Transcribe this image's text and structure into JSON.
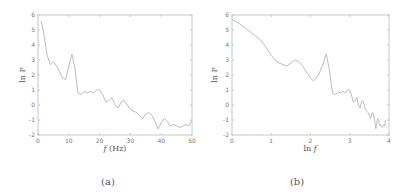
{
  "chart_data": [
    {
      "type": "line",
      "panel_caption": "(a)",
      "title": "",
      "xlabel": "f (Hz)",
      "ylabel": "ln P",
      "xlim": [
        0,
        50
      ],
      "ylim": [
        -2,
        6
      ],
      "xticks": [
        0,
        10,
        20,
        30,
        40,
        50
      ],
      "yticks": [
        -2,
        -1,
        0,
        1,
        2,
        3,
        4,
        5,
        6
      ],
      "grid": false,
      "legend": null,
      "x": [
        1,
        2,
        3,
        4,
        5,
        6,
        7,
        8,
        9,
        10,
        11,
        12,
        13,
        14,
        15,
        16,
        17,
        18,
        19,
        20,
        21,
        22,
        23,
        24,
        25,
        26,
        27,
        28,
        29,
        30,
        31,
        32,
        33,
        34,
        35,
        36,
        37,
        38,
        39,
        40,
        41,
        42,
        43,
        44,
        45,
        46,
        47,
        48,
        49,
        50
      ],
      "y": [
        5.6,
        4.6,
        3.3,
        2.7,
        2.9,
        2.6,
        2.2,
        1.8,
        1.7,
        2.6,
        3.4,
        2.4,
        0.8,
        0.7,
        0.9,
        0.8,
        0.9,
        0.8,
        1.0,
        1.0,
        0.7,
        0.2,
        0.3,
        0.5,
        0.0,
        -0.2,
        0.2,
        0.3,
        0.0,
        -0.3,
        -0.4,
        -0.5,
        -0.7,
        -0.9,
        -0.6,
        -0.5,
        -0.7,
        -1.1,
        -1.6,
        -1.2,
        -0.9,
        -1.1,
        -1.4,
        -1.3,
        -1.4,
        -1.5,
        -1.4,
        -1.3,
        -1.4,
        -1.0
      ]
    },
    {
      "type": "line",
      "panel_caption": "(b)",
      "title": "",
      "xlabel": "ln f",
      "ylabel": "ln P",
      "xlim": [
        0,
        4
      ],
      "ylim": [
        -2,
        6
      ],
      "xticks": [
        0,
        1,
        2,
        3,
        4
      ],
      "yticks": [
        -2,
        -1,
        0,
        1,
        2,
        3,
        4,
        5,
        6
      ],
      "grid": false,
      "legend": null,
      "x": [
        0.0,
        0.2,
        0.4,
        0.6,
        0.7,
        0.8,
        0.9,
        1.0,
        1.1,
        1.2,
        1.3,
        1.4,
        1.5,
        1.6,
        1.7,
        1.8,
        1.9,
        2.0,
        2.08,
        2.2,
        2.3,
        2.4,
        2.48,
        2.56,
        2.64,
        2.71,
        2.77,
        2.83,
        2.89,
        2.94,
        3.0,
        3.04,
        3.09,
        3.14,
        3.18,
        3.22,
        3.26,
        3.3,
        3.33,
        3.37,
        3.4,
        3.43,
        3.47,
        3.5,
        3.53,
        3.56,
        3.58,
        3.61,
        3.64,
        3.66,
        3.69,
        3.71,
        3.74,
        3.76,
        3.78,
        3.81,
        3.83,
        3.85,
        3.87,
        3.89,
        3.91
      ],
      "y": [
        5.7,
        5.4,
        5.0,
        4.6,
        4.4,
        4.1,
        3.7,
        3.3,
        3.0,
        2.8,
        2.7,
        2.6,
        2.8,
        3.0,
        2.9,
        2.6,
        2.2,
        1.8,
        1.6,
        2.0,
        2.6,
        3.4,
        2.4,
        0.8,
        0.7,
        0.9,
        0.8,
        0.9,
        0.8,
        1.0,
        1.0,
        0.7,
        0.2,
        0.3,
        0.5,
        0.0,
        -0.2,
        0.2,
        0.3,
        0.0,
        -0.3,
        -0.4,
        -0.5,
        -0.7,
        -0.9,
        -0.6,
        -0.5,
        -0.7,
        -1.1,
        -1.6,
        -1.2,
        -0.9,
        -1.1,
        -1.4,
        -1.3,
        -1.4,
        -1.5,
        -1.4,
        -1.3,
        -1.4,
        -1.0
      ]
    }
  ],
  "panels": {
    "a": {
      "caption": "(a)",
      "xlabel_italic": "f",
      "xlabel_rest": " (Hz)",
      "ylabel": "ln P",
      "xtick_labels": [
        "0",
        "10",
        "20",
        "30",
        "40",
        "50"
      ],
      "ytick_labels": [
        "-2",
        "-1",
        "0",
        "1",
        "2",
        "3",
        "4",
        "5",
        "6"
      ]
    },
    "b": {
      "caption": "(b)",
      "xlabel_rest": "ln ",
      "xlabel_italic": "f",
      "ylabel": "ln P",
      "xtick_labels": [
        "0",
        "1",
        "2",
        "3",
        "4"
      ],
      "ytick_labels": [
        "-2",
        "-1",
        "0",
        "1",
        "2",
        "3",
        "4",
        "5",
        "6"
      ]
    }
  },
  "colors": {
    "axis": "#c8c8c8",
    "line": "#bdbdbd",
    "text": "#666666"
  }
}
